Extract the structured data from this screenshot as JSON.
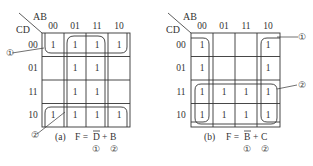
{
  "maps": [
    {
      "id": "a",
      "corner": {
        "col_var": "AB",
        "row_var": "CD"
      },
      "col_labels": [
        "00",
        "01",
        "11",
        "10"
      ],
      "row_labels": [
        "00",
        "01",
        "11",
        "10"
      ],
      "cells": [
        [
          "1",
          "1",
          "1",
          "1"
        ],
        [
          "",
          "1",
          "1",
          ""
        ],
        [
          "",
          "1",
          "1",
          ""
        ],
        [
          "1",
          "1",
          "1",
          "1"
        ]
      ],
      "groups": [
        {
          "marker": "①",
          "term": "D̄",
          "description": "rows 00 and 10 (wrap-around), all columns"
        },
        {
          "marker": "②",
          "term": "B",
          "description": "columns 01 and 11, all rows"
        }
      ],
      "caption": {
        "prefix": "(a)",
        "lhs": "F =",
        "term1": "D",
        "plus": "+",
        "term2": "B",
        "mark1": "①",
        "mark2": "②"
      }
    },
    {
      "id": "b",
      "corner": {
        "col_var": "AB",
        "row_var": "CD"
      },
      "col_labels": [
        "00",
        "01",
        "11",
        "10"
      ],
      "row_labels": [
        "00",
        "01",
        "11",
        "10"
      ],
      "cells": [
        [
          "1",
          "",
          "",
          "1"
        ],
        [
          "1",
          "",
          "",
          "1"
        ],
        [
          "1",
          "1",
          "1",
          "1"
        ],
        [
          "1",
          "1",
          "1",
          "1"
        ]
      ],
      "groups": [
        {
          "marker": "①",
          "term": "B̄",
          "description": "columns 00 and 10 (wrap-around), all rows"
        },
        {
          "marker": "②",
          "term": "C",
          "description": "rows 11 and 10, all columns"
        }
      ],
      "caption": {
        "prefix": "(b)",
        "lhs": "F =",
        "term1": "B",
        "plus": "+",
        "term2": "C",
        "mark1": "①",
        "mark2": "②"
      }
    }
  ],
  "colors": {
    "line": "#333333",
    "background": "#ffffff"
  }
}
